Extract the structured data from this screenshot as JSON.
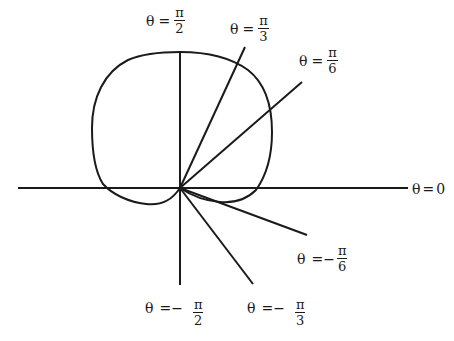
{
  "diagram": {
    "colors": {
      "stroke": "#1a1a1a",
      "background": "#ffffff"
    },
    "labels": {
      "theta_0": {
        "theta": "θ",
        "eq": "=",
        "value": "0"
      },
      "theta_pi_6": {
        "theta": "θ",
        "eq": "=",
        "num": "π",
        "den": "6"
      },
      "theta_pi_3": {
        "theta": "θ",
        "eq": "=",
        "num": "π",
        "den": "3"
      },
      "theta_pi_2": {
        "theta": "θ",
        "eq": "=",
        "num": "π",
        "den": "2"
      },
      "theta_neg_pi_6": {
        "theta": "θ",
        "eq": "=−",
        "num": "π",
        "den": "6"
      },
      "theta_neg_pi_3": {
        "theta": "θ",
        "eq": "=−",
        "num": "π",
        "den": "3"
      },
      "theta_neg_pi_2": {
        "theta": "θ",
        "eq": "=−",
        "num": "π",
        "den": "2"
      }
    },
    "rays": [
      {
        "name": "theta-0",
        "angle": "0"
      },
      {
        "name": "theta-pi-6",
        "angle": "π/6"
      },
      {
        "name": "theta-pi-3",
        "angle": "π/3"
      },
      {
        "name": "theta-pi-2",
        "angle": "π/2"
      },
      {
        "name": "theta-neg-pi-6",
        "angle": "-π/6"
      },
      {
        "name": "theta-neg-pi-3",
        "angle": "-π/3"
      },
      {
        "name": "theta-neg-pi-2",
        "angle": "-π/2"
      }
    ]
  }
}
